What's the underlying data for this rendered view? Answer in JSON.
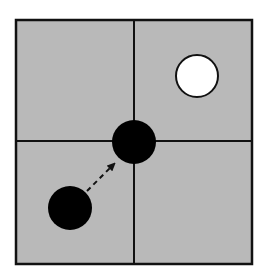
{
  "diagram": {
    "background": "#ffffff",
    "board": {
      "fill": "#b9b9b9",
      "stroke": "#111111",
      "x": 16,
      "y": 20,
      "width": 236,
      "height": 244,
      "divider_x": 134,
      "divider_y": 141
    },
    "pieces": [
      {
        "name": "white-piece",
        "cx": 197,
        "cy": 76,
        "r": 21,
        "fill": "#ffffff",
        "stroke": "#111111"
      },
      {
        "name": "black-piece-center",
        "cx": 134,
        "cy": 142,
        "r": 22,
        "fill": "#000000",
        "stroke": "#000000"
      },
      {
        "name": "black-piece-origin",
        "cx": 70,
        "cy": 208,
        "r": 22,
        "fill": "#000000",
        "stroke": "#000000"
      }
    ],
    "move_arrow": {
      "x1": 87,
      "y1": 191,
      "x2": 116,
      "y2": 162,
      "style": "dashed",
      "color": "#111111"
    }
  }
}
